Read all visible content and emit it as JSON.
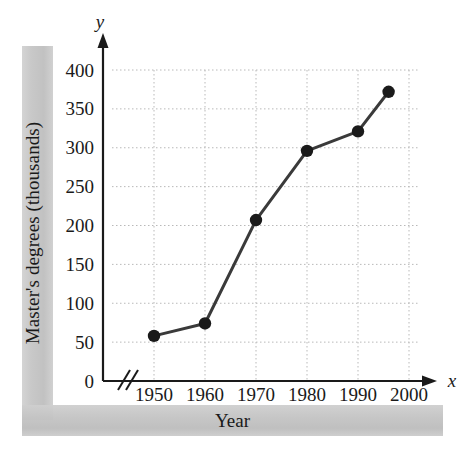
{
  "figure": {
    "xlabel": "Year",
    "ylabel": "Master's degrees (thousands)",
    "x_axis_letter": "x",
    "y_axis_letter": "y",
    "axis_break_symbol": "//"
  },
  "colors": {
    "line": "#3a3a3a",
    "marker": "#1a1a1a",
    "axis": "#1a1a1a",
    "gridline": "#b9b9b9",
    "frame_gray": "#c6c6c6",
    "background": "#ffffff"
  },
  "chart_data": {
    "type": "line",
    "title": "",
    "xlabel": "Year",
    "ylabel": "Master's degrees (thousands)",
    "x": [
      1950,
      1960,
      1970,
      1980,
      1990,
      1996
    ],
    "values": [
      58,
      74,
      207,
      296,
      321,
      372
    ],
    "series": [
      {
        "name": "Master's degrees",
        "values": [
          58,
          74,
          207,
          296,
          321,
          372
        ]
      }
    ],
    "xlim": [
      1945,
      2003
    ],
    "ylim": [
      0,
      410
    ],
    "xticks": [
      1950,
      1960,
      1970,
      1980,
      1990,
      2000
    ],
    "xtick_labels": [
      "1950",
      "1960",
      "1970",
      "1980",
      "1990",
      "2000"
    ],
    "yticks": [
      0,
      50,
      100,
      150,
      200,
      250,
      300,
      350,
      400
    ],
    "ytick_labels": [
      "0",
      "50",
      "100",
      "150",
      "200",
      "250",
      "300",
      "350",
      "400"
    ],
    "grid": true,
    "grid_style": "dotted",
    "legend": null,
    "legend_position": "none",
    "axis_break_x": true,
    "marker": "circle",
    "annotations": []
  }
}
